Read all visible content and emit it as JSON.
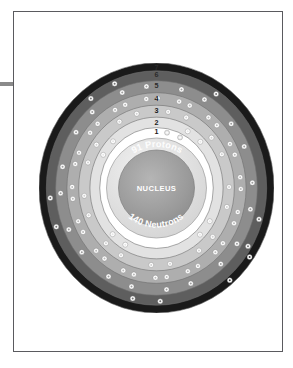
{
  "page": {
    "background_color": "#ffffff",
    "frame_color": "#5a5a5e",
    "edge_artifact_color": "#8a8a8a"
  },
  "diagram": {
    "nucleus": {
      "protons_label": "91 Protons",
      "center_label": "NUCLEUS",
      "neutrons_label": "140 Neutrons",
      "protons": 91,
      "neutrons": 140
    },
    "shell_labels": [
      "1",
      "2",
      "3",
      "4",
      "5",
      "6",
      "7"
    ],
    "shells": [
      {
        "number": 1,
        "label": "1",
        "electrons": 2,
        "radius": 58.0,
        "band_width": 8.5,
        "color": "#ffffff",
        "electron_color": "#e9e9e9"
      },
      {
        "number": 2,
        "label": "2",
        "electrons": 8,
        "radius": 68.0,
        "band_width": 11.0,
        "color": "#e2e2e2",
        "electron_color": "#ffffff"
      },
      {
        "number": 3,
        "label": "3",
        "electrons": 18,
        "radius": 79.5,
        "band_width": 12.0,
        "color": "#c9c9c9",
        "electron_color": "#ffffff"
      },
      {
        "number": 4,
        "label": "4",
        "electrons": 32,
        "radius": 91.5,
        "band_width": 12.0,
        "color": "#aeaeae",
        "electron_color": "#ffffff"
      },
      {
        "number": 5,
        "label": "5",
        "electrons": 20,
        "radius": 103.0,
        "band_width": 11.0,
        "color": "#8d8d8d",
        "electron_color": "#ffffff"
      },
      {
        "number": 6,
        "label": "6",
        "electrons": 9,
        "radius": 112.5,
        "band_width": 8.0,
        "color": "#5e5e5e",
        "electron_color": "#ffffff"
      },
      {
        "number": 7,
        "label": "7",
        "electrons": 2,
        "radius": 120.0,
        "band_width": 9.0,
        "color": "#1a1a1a",
        "electron_color": "#ffffff"
      }
    ],
    "colors": {
      "outer_ring": "#1a1a1a",
      "nucleus_fill": "#9a9a9a",
      "nucleus_rim": "#dcdcdc",
      "electron": "#ffffff",
      "shell_outline": "#6f6f6f"
    }
  }
}
